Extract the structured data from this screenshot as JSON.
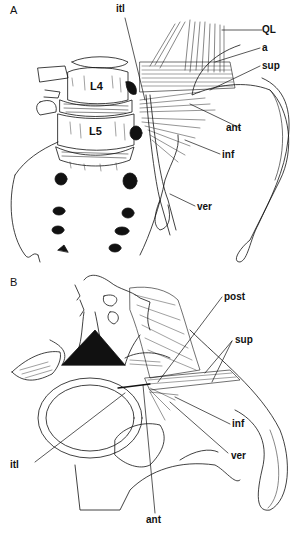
{
  "figure": {
    "background": "#ffffff",
    "ink": "#111111",
    "panels": [
      {
        "id": "A",
        "label": "A",
        "vertebrae": [
          "L4",
          "L5"
        ],
        "annotations": [
          "itl",
          "QL",
          "a",
          "sup",
          "ant",
          "inf",
          "ver"
        ]
      },
      {
        "id": "B",
        "label": "B",
        "annotations": [
          "post",
          "sup",
          "inf",
          "ver",
          "itl",
          "ant"
        ]
      }
    ]
  },
  "panelA": {
    "label": "A",
    "vertebra_l4": "L4",
    "vertebra_l5": "L5",
    "labels": {
      "itl": "itl",
      "ql": "QL",
      "a": "a",
      "sup": "sup",
      "ant": "ant",
      "inf": "inf",
      "ver": "ver"
    }
  },
  "panelB": {
    "label": "B",
    "labels": {
      "post": "post",
      "sup": "sup",
      "inf": "inf",
      "ver": "ver",
      "itl": "itl",
      "ant": "ant"
    }
  }
}
